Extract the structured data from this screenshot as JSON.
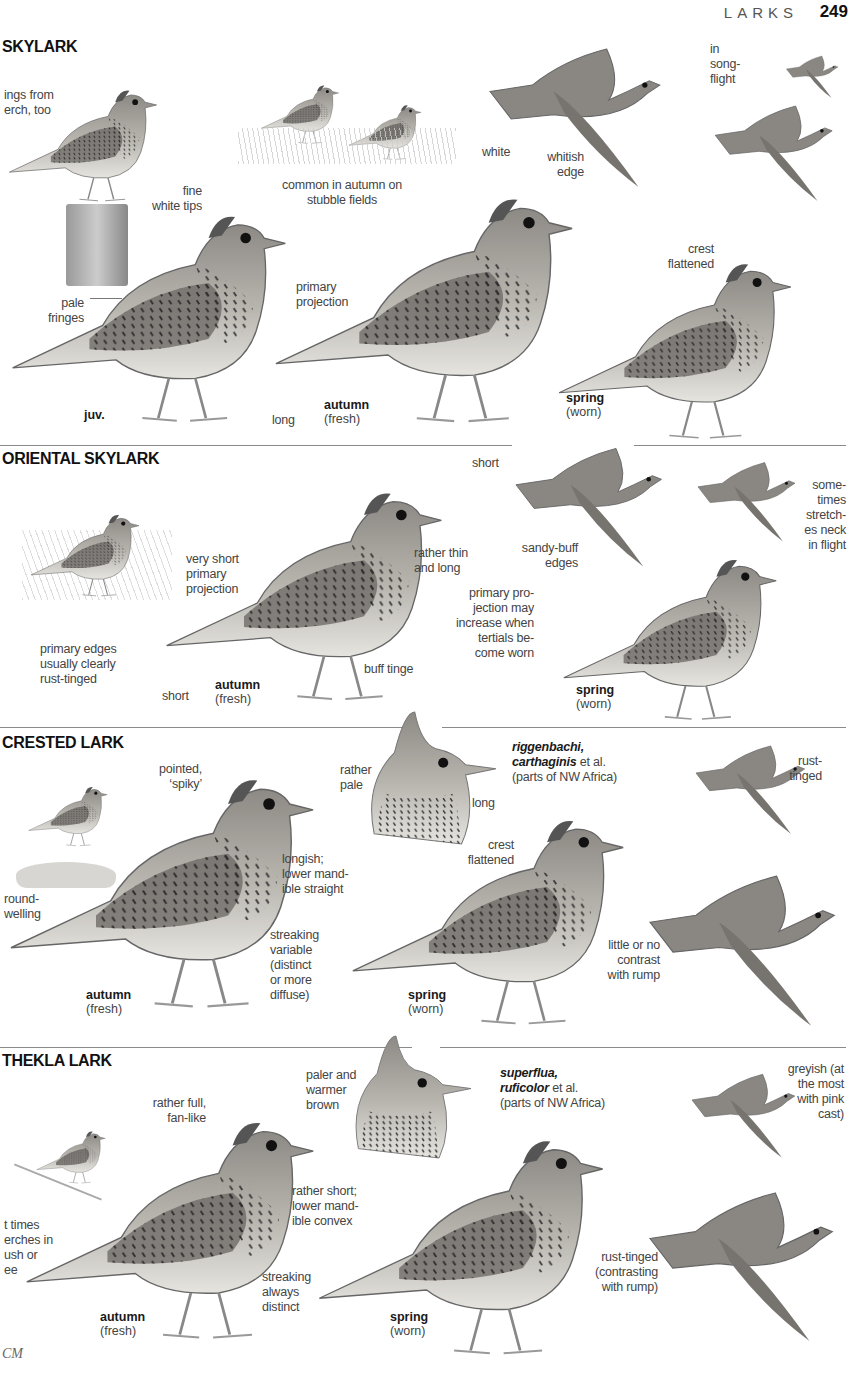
{
  "header": {
    "section": "LARKS",
    "page_number": "249"
  },
  "species": [
    {
      "name": "SKYLARK",
      "labels": {
        "perch": "ings from\nerch, too",
        "stubble": "common in autumn on\nstubble fields",
        "white": "white",
        "whitish_edge": "whitish\nedge",
        "song_flight": "in\nsong-\nflight",
        "fine_white_tips": "fine\nwhite tips",
        "pale_fringes": "pale\nfringes",
        "primary_projection": "primary\nprojection",
        "long": "long",
        "crest_flattened": "crest\nflattened"
      },
      "ages": [
        {
          "age": "juv.",
          "state": ""
        },
        {
          "age": "autumn",
          "state": "(fresh)"
        },
        {
          "age": "spring",
          "state": "(worn)"
        }
      ]
    },
    {
      "name": "ORIENTAL SKYLARK",
      "labels": {
        "primary_edges": "primary edges\nusually clearly\nrust-tinged",
        "very_short_pp": "very short\nprimary\nprojection",
        "short_tail": "short",
        "thin_long": "rather thin\nand long",
        "buff_tinge": "buff tinge",
        "short_flight": "short",
        "sandy_buff": "sandy-buff\nedges",
        "stretches_neck": "some-\ntimes\nstretch-\nes neck\nin flight",
        "pp_increase": "primary pro-\njection may\nincrease when\ntertials be-\ncome worn"
      },
      "ages": [
        {
          "age": "autumn",
          "state": "(fresh)"
        },
        {
          "age": "spring",
          "state": "(worn)"
        }
      ]
    },
    {
      "name": "CRESTED LARK",
      "labels": {
        "round_welling": "round-\nwelling",
        "pointed_spiky": "pointed,\n‘spiky’",
        "longish": "longish;\nlower mand-\nible straight",
        "streaking_variable": "streaking\nvariable\n(distinct\nor more\ndiffuse)",
        "rather_pale": "rather\npale",
        "long": "long",
        "subspecies_bold": "riggenbachi,\ncarthaginis",
        "subspecies_etal": " et al.",
        "subspecies_region": "(parts of NW Africa)",
        "crest_flattened": "crest\nflattened",
        "rust_tinged": "rust-\ntinged",
        "little_contrast": "little or no\ncontrast\nwith rump"
      },
      "ages": [
        {
          "age": "autumn",
          "state": "(fresh)"
        },
        {
          "age": "spring",
          "state": "(worn)"
        }
      ]
    },
    {
      "name": "THEKLA LARK",
      "labels": {
        "perches": "t times\nerches in\nush or\nee",
        "fan_like": "rather full,\nfan-like",
        "rather_short": "rather short;\nlower mand-\nible convex",
        "streaking_distinct": "streaking\nalways\ndistinct",
        "paler_warmer": "paler and\nwarmer\nbrown",
        "subspecies_bold": "superflua,\nruficolor",
        "subspecies_etal": " et al.",
        "subspecies_region": "(parts of NW Africa)",
        "greyish": "greyish (at\nthe most\nwith pink\ncast)",
        "rust_tinged": "rust-tinged\n(contrasting\nwith rump)"
      },
      "ages": [
        {
          "age": "autumn",
          "state": "(fresh)"
        },
        {
          "age": "spring",
          "state": "(worn)"
        }
      ]
    }
  ],
  "footer": {
    "initials": "CM"
  }
}
